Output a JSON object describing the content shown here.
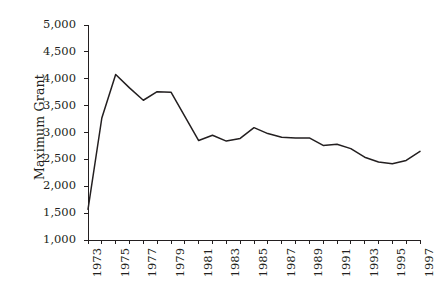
{
  "chart_data": {
    "type": "line",
    "title": "",
    "subtitle": "",
    "xlabel": "",
    "ylabel": "Maximum Grant",
    "x": [
      1973,
      1974,
      1975,
      1976,
      1977,
      1978,
      1979,
      1980,
      1981,
      1982,
      1983,
      1984,
      1985,
      1986,
      1987,
      1988,
      1989,
      1990,
      1991,
      1992,
      1993,
      1994,
      1995,
      1996,
      1997
    ],
    "values": [
      1570,
      3270,
      4080,
      3830,
      3600,
      3760,
      3750,
      3300,
      2850,
      2950,
      2840,
      2890,
      3090,
      2980,
      2910,
      2900,
      2900,
      2760,
      2780,
      2700,
      2540,
      2450,
      2420,
      2480,
      2650
    ],
    "series": [
      {
        "name": "Maximum Grant",
        "values": [
          1570,
          3270,
          4080,
          3830,
          3600,
          3760,
          3750,
          3300,
          2850,
          2950,
          2840,
          2890,
          3090,
          2980,
          2910,
          2900,
          2900,
          2760,
          2780,
          2700,
          2540,
          2450,
          2420,
          2480,
          2650
        ]
      }
    ],
    "xlim": [
      1973,
      1997
    ],
    "ylim": [
      1000,
      5000
    ],
    "ytick_values": [
      1000,
      1500,
      2000,
      2500,
      3000,
      3500,
      4000,
      4500,
      5000
    ],
    "ytick_labels": [
      "1,000",
      "1,500",
      "2,000",
      "2,500",
      "3,000",
      "3,500",
      "4,000",
      "4,500",
      "5,000"
    ],
    "xtick_values": [
      1973,
      1974,
      1975,
      1976,
      1977,
      1978,
      1979,
      1980,
      1981,
      1982,
      1983,
      1984,
      1985,
      1986,
      1987,
      1988,
      1989,
      1990,
      1991,
      1992,
      1993,
      1994,
      1995,
      1996,
      1997
    ],
    "xtick_labels": [
      "1973",
      "",
      "1975",
      "",
      "1977",
      "",
      "1979",
      "",
      "1981",
      "",
      "1983",
      "",
      "1985",
      "",
      "1987",
      "",
      "1989",
      "",
      "1991",
      "",
      "1993",
      "",
      "1995",
      "",
      "1997"
    ],
    "grid": false,
    "legend": false,
    "legend_position": "none",
    "line_color": "#231f20",
    "background_color": "#ffffff",
    "axis_color": "#231f20"
  }
}
